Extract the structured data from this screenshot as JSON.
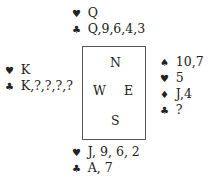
{
  "hands": {
    "north": [
      {
        "suit": "hearts",
        "symbol": "♥",
        "cards": "Q"
      },
      {
        "suit": "clubs",
        "symbol": "♣",
        "cards": "Q,9,6,4,3"
      }
    ],
    "west": [
      {
        "suit": "hearts",
        "symbol": "♥",
        "cards": "K"
      },
      {
        "suit": "clubs",
        "symbol": "♣",
        "cards": "K,?,?,?,?"
      }
    ],
    "east": [
      {
        "suit": "spades",
        "symbol": "♠",
        "cards": "10,7"
      },
      {
        "suit": "hearts",
        "symbol": "♥",
        "cards": "5"
      },
      {
        "suit": "diamonds",
        "symbol": "♦",
        "cards": "J,4"
      },
      {
        "suit": "clubs",
        "symbol": "♣",
        "cards": "?"
      }
    ],
    "south": [
      {
        "suit": "hearts",
        "symbol": "♥",
        "cards": "J, 9, 6, 2"
      },
      {
        "suit": "clubs",
        "symbol": "♣",
        "cards": "A, 7"
      }
    ]
  },
  "compass": {
    "north": "N",
    "west": "W",
    "east": "E",
    "south": "S"
  }
}
